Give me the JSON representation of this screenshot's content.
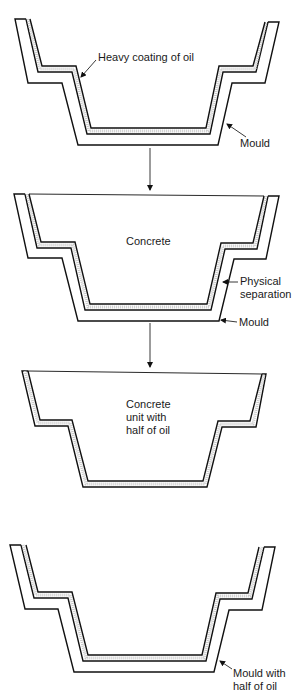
{
  "diagram": {
    "stages": [
      {
        "id": "stage-1",
        "labels": {
          "oil": "Heavy coating of oil",
          "mould": "Mould"
        }
      },
      {
        "id": "stage-2",
        "labels": {
          "concrete": "Concrete",
          "separation_line1": "Physical",
          "separation_line2": "separation",
          "mould": "Mould"
        }
      },
      {
        "id": "stage-3",
        "labels": {
          "unit_line1": "Concrete",
          "unit_line2": "unit with",
          "unit_line3": "half of oil"
        }
      },
      {
        "id": "stage-4",
        "labels": {
          "mould_line1": "Mould with",
          "mould_line2": "half of oil"
        }
      }
    ],
    "colors": {
      "line": "#111111",
      "oil": "#c8c8c8",
      "background": "#ffffff"
    }
  }
}
